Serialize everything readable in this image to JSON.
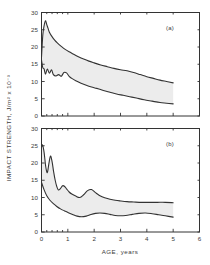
{
  "figure": {
    "background": "#ffffff",
    "ink": "#333333",
    "band_fill": "#ececec"
  },
  "axis": {
    "y_title": "IMPACT STRENGTH,  J/m² x 10⁻³",
    "x_title": "AGE,  years",
    "y_ticks": [
      "0",
      "5",
      "10",
      "15",
      "20",
      "25",
      "30"
    ],
    "x_ticks": [
      "0",
      "1",
      "2",
      "3",
      "4",
      "5",
      "6"
    ],
    "y_values": [
      0,
      5,
      10,
      15,
      20,
      25,
      30
    ],
    "x_values": [
      0,
      1,
      2,
      3,
      4,
      5,
      6
    ],
    "ylim": [
      0,
      30
    ],
    "xlim": [
      0,
      6
    ],
    "minor_x_ticks": [
      0.2,
      0.4,
      0.6,
      0.8
    ],
    "grid": false
  },
  "panels": [
    {
      "id": "a",
      "label": "(a)"
    },
    {
      "id": "b",
      "label": "(b)"
    }
  ],
  "chart_data": [
    {
      "type": "line",
      "title": "(a)",
      "xlabel": "AGE,  years",
      "ylabel": "IMPACT STRENGTH,  J/m² x 10⁻³",
      "xlim": [
        0,
        6
      ],
      "ylim": [
        0,
        30
      ],
      "grid": false,
      "legend": "none",
      "shaded_band": true,
      "series": [
        {
          "name": "upper bound",
          "x": [
            0.0,
            0.05,
            0.1,
            0.15,
            0.2,
            0.25,
            0.3,
            0.4,
            0.5,
            0.6,
            0.75,
            0.9,
            1.05,
            1.2,
            1.4,
            1.6,
            1.8,
            2.0,
            2.25,
            2.5,
            2.75,
            3.0,
            3.25,
            3.5,
            3.75,
            4.0,
            4.25,
            4.5,
            4.75,
            5.0
          ],
          "values": [
            17.0,
            23.5,
            26.2,
            27.6,
            26.5,
            25.4,
            24.3,
            23.0,
            22.0,
            21.2,
            20.2,
            19.3,
            18.6,
            18.0,
            17.2,
            16.5,
            15.9,
            15.4,
            14.8,
            14.3,
            13.8,
            13.4,
            13.1,
            12.6,
            12.0,
            11.4,
            10.9,
            10.4,
            10.0,
            9.6
          ]
        },
        {
          "name": "lower bound",
          "x": [
            0.0,
            0.05,
            0.1,
            0.15,
            0.22,
            0.3,
            0.38,
            0.45,
            0.55,
            0.65,
            0.75,
            0.85,
            0.95,
            1.05,
            1.15,
            1.3,
            1.5,
            1.7,
            1.9,
            2.1,
            2.35,
            2.6,
            2.85,
            3.1,
            3.35,
            3.6,
            3.9,
            4.2,
            4.5,
            4.75,
            5.0
          ],
          "values": [
            16.2,
            14.0,
            13.6,
            12.1,
            13.6,
            12.4,
            13.4,
            12.0,
            11.6,
            12.0,
            11.5,
            12.6,
            12.5,
            11.5,
            10.9,
            10.2,
            9.5,
            8.9,
            8.4,
            8.0,
            7.4,
            6.9,
            6.4,
            6.0,
            5.6,
            5.2,
            4.7,
            4.3,
            3.9,
            3.7,
            3.5
          ]
        }
      ]
    },
    {
      "type": "line",
      "title": "(b)",
      "xlabel": "AGE,  years",
      "ylabel": "IMPACT STRENGTH,  J/m² x 10⁻³",
      "xlim": [
        0,
        6
      ],
      "ylim": [
        0,
        30
      ],
      "grid": false,
      "legend": "none",
      "shaded_band": true,
      "series": [
        {
          "name": "upper bound",
          "x": [
            0.0,
            0.04,
            0.1,
            0.16,
            0.22,
            0.28,
            0.34,
            0.4,
            0.46,
            0.52,
            0.58,
            0.64,
            0.72,
            0.8,
            0.88,
            0.96,
            1.05,
            1.15,
            1.3,
            1.45,
            1.6,
            1.75,
            1.9,
            2.05,
            2.2,
            2.4,
            2.6,
            2.8,
            3.0,
            3.25,
            3.5,
            3.8,
            4.1,
            4.4,
            4.7,
            5.0
          ],
          "values": [
            24.6,
            25.2,
            23.0,
            19.0,
            17.2,
            19.8,
            22.0,
            20.5,
            17.5,
            15.0,
            13.2,
            12.2,
            12.6,
            13.4,
            13.2,
            12.4,
            11.6,
            11.0,
            10.4,
            10.0,
            10.8,
            12.0,
            12.3,
            11.4,
            10.6,
            9.9,
            9.5,
            9.2,
            9.0,
            8.8,
            8.7,
            8.6,
            8.6,
            8.6,
            8.6,
            8.5
          ]
        },
        {
          "name": "lower bound",
          "x": [
            0.0,
            0.1,
            0.2,
            0.32,
            0.45,
            0.58,
            0.72,
            0.88,
            1.02,
            1.18,
            1.35,
            1.52,
            1.7,
            1.88,
            2.05,
            2.22,
            2.4,
            2.6,
            2.8,
            3.0,
            3.2,
            3.45,
            3.7,
            3.95,
            4.2,
            4.45,
            4.7,
            5.0
          ],
          "values": [
            14.4,
            12.2,
            10.5,
            9.2,
            8.2,
            7.4,
            6.7,
            6.1,
            5.6,
            5.1,
            4.6,
            4.4,
            4.6,
            5.1,
            5.4,
            5.5,
            5.4,
            5.1,
            4.8,
            4.7,
            4.8,
            5.1,
            5.4,
            5.5,
            5.3,
            5.0,
            4.7,
            4.3
          ]
        }
      ]
    }
  ]
}
